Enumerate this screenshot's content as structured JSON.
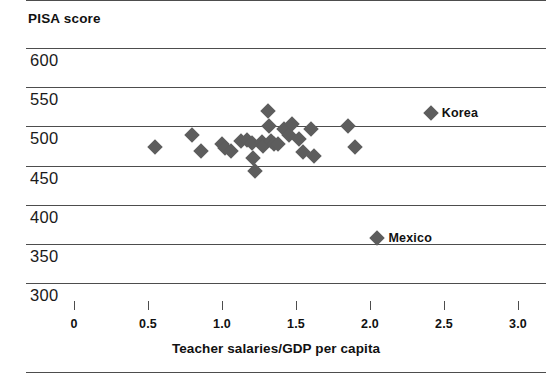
{
  "chart_data": {
    "type": "scatter",
    "title": "PISA score",
    "xlabel": "Teacher salaries/GDP per capita",
    "ylabel": "PISA score",
    "xlim": [
      -0.5,
      3.0
    ],
    "ylim": [
      300,
      600
    ],
    "xticks": [
      0,
      0.5,
      1.0,
      1.5,
      2.0,
      2.5,
      3.0
    ],
    "xticklabels": [
      "0",
      "0.5",
      "1.0",
      "1.5",
      "2.0",
      "2.5",
      "3.0"
    ],
    "yticks": [
      300,
      350,
      400,
      450,
      500,
      550,
      600
    ],
    "yticklabels": [
      "300",
      "350",
      "400",
      "450",
      "500",
      "550",
      "600"
    ],
    "grid": "horizontal",
    "legend": "none",
    "marker": "diamond",
    "marker_color": "#5d5d5d",
    "points": [
      {
        "x": 0.55,
        "y": 474
      },
      {
        "x": 0.8,
        "y": 489
      },
      {
        "x": 0.86,
        "y": 469
      },
      {
        "x": 1.0,
        "y": 478
      },
      {
        "x": 1.02,
        "y": 472
      },
      {
        "x": 1.06,
        "y": 468
      },
      {
        "x": 1.13,
        "y": 481
      },
      {
        "x": 1.17,
        "y": 483
      },
      {
        "x": 1.2,
        "y": 479
      },
      {
        "x": 1.21,
        "y": 460
      },
      {
        "x": 1.22,
        "y": 443
      },
      {
        "x": 1.27,
        "y": 480
      },
      {
        "x": 1.28,
        "y": 475
      },
      {
        "x": 1.31,
        "y": 520
      },
      {
        "x": 1.32,
        "y": 500
      },
      {
        "x": 1.33,
        "y": 481
      },
      {
        "x": 1.35,
        "y": 478
      },
      {
        "x": 1.38,
        "y": 477
      },
      {
        "x": 1.42,
        "y": 497
      },
      {
        "x": 1.45,
        "y": 489
      },
      {
        "x": 1.47,
        "y": 503
      },
      {
        "x": 1.52,
        "y": 484
      },
      {
        "x": 1.55,
        "y": 467
      },
      {
        "x": 1.6,
        "y": 497
      },
      {
        "x": 1.62,
        "y": 462
      },
      {
        "x": 1.85,
        "y": 501
      },
      {
        "x": 1.9,
        "y": 474
      },
      {
        "x": 2.41,
        "y": 517
      }
    ],
    "annotations": [
      {
        "name": "Korea",
        "label": "Korea",
        "x": 2.41,
        "y": 517,
        "marker": true
      },
      {
        "name": "Mexico",
        "label": "Mexico",
        "x": 2.05,
        "y": 357,
        "marker": true
      }
    ]
  },
  "colors": {
    "marker": "#5d5d5d",
    "axis": "#4d4d4d",
    "text": "#111111",
    "background": "#ffffff"
  }
}
